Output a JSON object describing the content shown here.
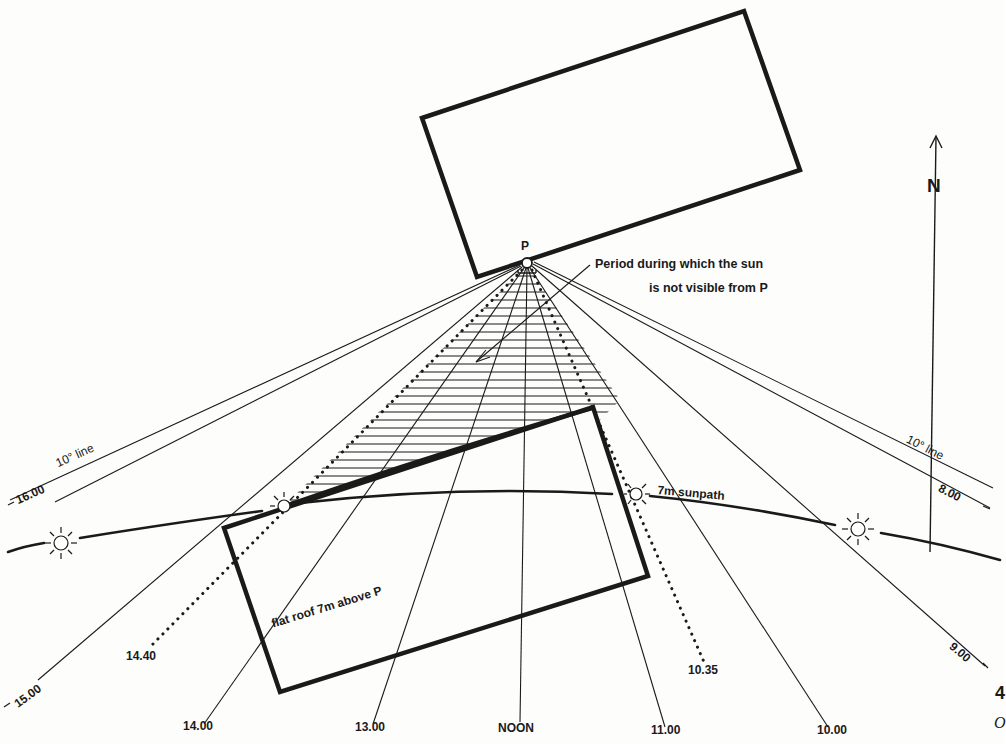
{
  "diagram": {
    "title_note": "Period during which the sun is not visible from P",
    "annotation": {
      "line1": "Period during which the sun",
      "line2": "is not visible from P"
    },
    "point_label": "P",
    "north_label": "N",
    "roof_label": "flat roof 7m above P",
    "sunpath_label": "7m sunpath",
    "ten_degree_left": "10° line",
    "ten_degree_right": "10° line",
    "time_labels": {
      "t1600": "16.00",
      "t1500": "15.00",
      "t1440": "14.40",
      "t1400": "14.00",
      "t1300": "13.00",
      "noon": "NOON",
      "t1100": "11.00",
      "t1035": "10.35",
      "t1000": "10.00",
      "t0900": "9.00",
      "t0800": "8.00"
    },
    "page_fragment": {
      "number": "4",
      "letter": "O"
    },
    "shade_period": {
      "start": "10.35",
      "end": "14.40"
    },
    "colors": {
      "ink": "#1a1a1a",
      "paper": "#fdfdfc"
    }
  }
}
